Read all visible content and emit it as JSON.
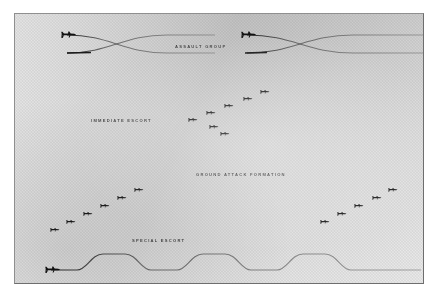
{
  "plate": {
    "kind": "scanned-photographic-plate",
    "background_color": "#ffffff",
    "photo_color": "#cfcfcf",
    "border_color": "#7d7d7d",
    "ink_color": "#2b2b2b"
  },
  "formations": [
    {
      "id": "assault-group",
      "label": "ASSAULT   GROUP",
      "pattern": "crossing-weave",
      "groups": 2,
      "lines_per_group": 2,
      "aircraft_count": 3,
      "description": "Two pairs of flight paths that cross in an X / scissors weave, each pair led by an aircraft at the left."
    },
    {
      "id": "immediate-escort",
      "label": "IMMEDIATE   ESCORT",
      "pattern": "stepped-echelon-trails",
      "lines": 7,
      "aircraft_count": 7,
      "description": "Seven horizontal trailing paths starting at staggered points forming a stepped echelon, each headed by an aircraft."
    },
    {
      "id": "ground-attack-formation",
      "label": "GROUND   ATTACK   FORMATION",
      "pattern": "double-echelon-trails",
      "lines": 6,
      "aircraft_count": 11,
      "description": "Six long horizontal paths spanning the plate, with an ascending echelon of aircraft at the left and a descending echelon at the right."
    },
    {
      "id": "special-escort",
      "label": "SPECIAL   ESCORT",
      "pattern": "trapezoidal-weave",
      "lines": 1,
      "aircraft_count": 1,
      "description": "A single weaving flight path in a square / trapezoidal wave, led by an aircraft at the far left."
    }
  ],
  "labels": {
    "assault_group": "ASSAULT   GROUP",
    "immediate_escort": "IMMEDIATE   ESCORT",
    "ground_attack_formation": "GROUND   ATTACK   FORMATION",
    "special_escort": "SPECIAL   ESCORT"
  }
}
